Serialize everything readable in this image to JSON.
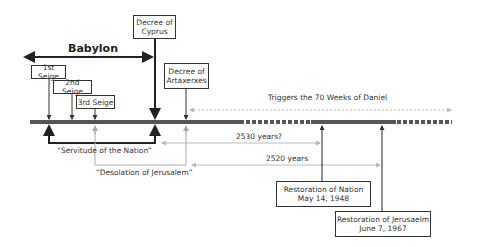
{
  "timeline": {
    "period_label": "Babylon",
    "events": [
      {
        "id": "decree-cyprus",
        "lines": [
          "Decree of",
          "Cyprus"
        ]
      },
      {
        "id": "first-seige",
        "lines": [
          "1st Seige"
        ]
      },
      {
        "id": "second-seige",
        "lines": [
          "2nd Seige"
        ]
      },
      {
        "id": "third-seige",
        "lines": [
          "3rd Seige"
        ]
      },
      {
        "id": "decree-artaxerxes",
        "lines": [
          "Decree of",
          "Artaxerxes"
        ]
      },
      {
        "id": "restoration-nation",
        "lines": [
          "Restoration of Nation",
          "May 14, 1948"
        ]
      },
      {
        "id": "restoration-jerusalem",
        "lines": [
          "Restoration of Jerusaelm",
          "June 7, 1967"
        ]
      }
    ],
    "spans": {
      "triggers": "Triggers the 70 Weeks of Daniel",
      "servitude": "“Servitude of the Nation”",
      "desolation": "“Desolation of Jerusalem”",
      "years_2530": "2530 years?",
      "years_2520": "2520 years"
    },
    "colors": {
      "dark": "#222222",
      "gray": "#aaaaaa",
      "bar": "#555555",
      "light_dash": "#bbbbbb"
    }
  }
}
